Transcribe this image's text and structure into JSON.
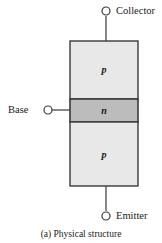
{
  "figure": {
    "caption": "(a) Physical structure",
    "background_color": "#ffffff",
    "line_color": "#3a3a3a"
  },
  "terminals": [
    {
      "name": "collector",
      "label": "Collector",
      "marker": "open-circle-terminal"
    },
    {
      "name": "base",
      "label": "Base",
      "marker": "open-circle-terminal"
    },
    {
      "name": "emitter",
      "label": "Emitter",
      "marker": "open-circle-terminal"
    }
  ],
  "regions": [
    {
      "name": "collector-region",
      "label": "p",
      "fill": "#e8e8e8"
    },
    {
      "name": "base-region",
      "label": "n",
      "fill": "#bcbcbc"
    },
    {
      "name": "emitter-region",
      "label": "p",
      "fill": "#e8e8e8"
    }
  ]
}
